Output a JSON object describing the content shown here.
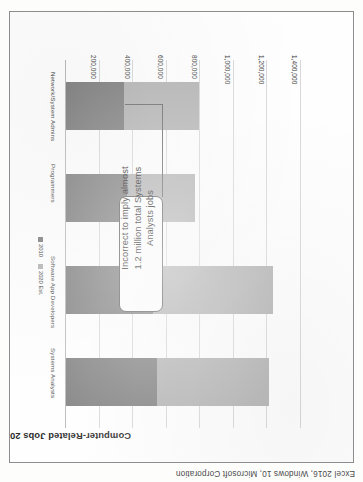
{
  "caption": "Excel 2016, Windows 10, Microsoft Corporation",
  "chart": {
    "title": "Computer-Related Jobs 2010 and 2020",
    "legend": [
      {
        "label": "2010",
        "color": "#7f7f7f"
      },
      {
        "label": "2020 Est.",
        "color": "#b3b3b3"
      }
    ],
    "callout": {
      "text": "Incorrect to imply almost 1.2 million total Systems Analysts jobs"
    }
  },
  "chart_data": {
    "type": "bar",
    "orientation": "horizontal",
    "stacked": true,
    "title": "Computer-Related Jobs 2010 and 2020",
    "xlabel": "",
    "ylabel": "",
    "categories": [
      "Systems Analysts",
      "Software App Developers",
      "Programmers",
      "Network/System Admins"
    ],
    "series": [
      {
        "name": "2010",
        "color": "#7f7f7f",
        "values": [
          544400,
          520800,
          363100,
          347200
        ]
      },
      {
        "name": "2020 Est.",
        "color": "#b3b3b3",
        "values": [
          664800,
          713700,
          406800,
          443800
        ]
      }
    ],
    "totals": [
      1209200,
      1234500,
      769900,
      791000
    ],
    "axis_ticks": [
      "200,000",
      "400,000",
      "600,000",
      "800,000",
      "1,000,000",
      "1,200,000",
      "1,400,000"
    ],
    "axis_tick_values": [
      200000,
      400000,
      600000,
      800000,
      1000000,
      1200000,
      1400000
    ],
    "xlim": [
      0,
      1400000
    ],
    "grid": true,
    "legend_position": "bottom"
  }
}
